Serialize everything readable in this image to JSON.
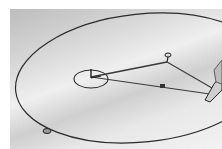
{
  "image": {
    "subject": "Drawing an ellipse with two pins, a loop of string and a pencil",
    "description": "Grayscale photo of paper with a large ellipse drawn in pencil; two foci pins connected by string to a pencil tip at right; a small circle drawn around the left focus; a small mark on the ellipse at bottom-left",
    "colors": {
      "paper_dark": "#bdbdbd",
      "paper_light": "#f2f2f2",
      "line": "#2a2a2a"
    },
    "elements": [
      {
        "name": "ellipse",
        "cx": 142,
        "cy": 78,
        "rx": 128,
        "ry": 66
      },
      {
        "name": "focus-circle",
        "cx": 91,
        "cy": 78,
        "r": 16
      },
      {
        "name": "focus-pin-left",
        "x": 91,
        "y": 70
      },
      {
        "name": "pin-top",
        "x": 168,
        "y": 55
      },
      {
        "name": "string-knot",
        "x": 162,
        "y": 86
      },
      {
        "name": "pencil-tip",
        "x": 207,
        "y": 93
      },
      {
        "name": "ellipse-mark",
        "x": 47,
        "y": 131
      }
    ]
  }
}
